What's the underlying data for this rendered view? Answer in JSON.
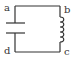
{
  "diagram": {
    "type": "LC circuit",
    "labels": {
      "a": "a",
      "b": "b",
      "c": "c",
      "d": "d"
    },
    "components": [
      {
        "name": "capacitor",
        "between": [
          "a",
          "d"
        ],
        "side": "left"
      },
      {
        "name": "inductor",
        "between": [
          "b",
          "c"
        ],
        "side": "right"
      }
    ],
    "colors": {
      "wire": "#333333",
      "background": "#ffffff"
    }
  }
}
